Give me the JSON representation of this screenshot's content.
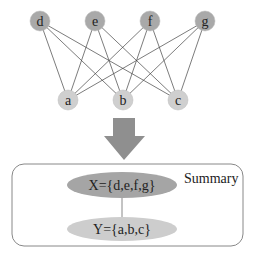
{
  "graph": {
    "top_nodes": [
      {
        "id": "d",
        "label": "d",
        "x": 40,
        "y": 21
      },
      {
        "id": "e",
        "label": "e",
        "x": 95,
        "y": 21
      },
      {
        "id": "f",
        "label": "f",
        "x": 150,
        "y": 21
      },
      {
        "id": "g",
        "label": "g",
        "x": 205,
        "y": 21
      }
    ],
    "bottom_nodes": [
      {
        "id": "a",
        "label": "a",
        "x": 68,
        "y": 100
      },
      {
        "id": "b",
        "label": "b",
        "x": 123,
        "y": 100
      },
      {
        "id": "c",
        "label": "c",
        "x": 178,
        "y": 100
      }
    ],
    "edges": [
      [
        "d",
        "a"
      ],
      [
        "d",
        "b"
      ],
      [
        "d",
        "c"
      ],
      [
        "e",
        "a"
      ],
      [
        "e",
        "b"
      ],
      [
        "e",
        "c"
      ],
      [
        "f",
        "a"
      ],
      [
        "f",
        "b"
      ],
      [
        "f",
        "c"
      ],
      [
        "g",
        "a"
      ],
      [
        "g",
        "b"
      ],
      [
        "g",
        "c"
      ]
    ]
  },
  "summary": {
    "title": "Summary",
    "x_node": "X={d,e,f,g}",
    "y_node": "Y={a,b,c}"
  },
  "colors": {
    "top_node_fill": "#a9a9a9",
    "bottom_node_fill": "#cfcfcf",
    "x_ellipse_fill": "#a5a5a5",
    "y_ellipse_fill": "#cdcdcd",
    "arrow_fill": "#8f8f8f",
    "edge_stroke": "#444444",
    "box_stroke": "#888888"
  }
}
